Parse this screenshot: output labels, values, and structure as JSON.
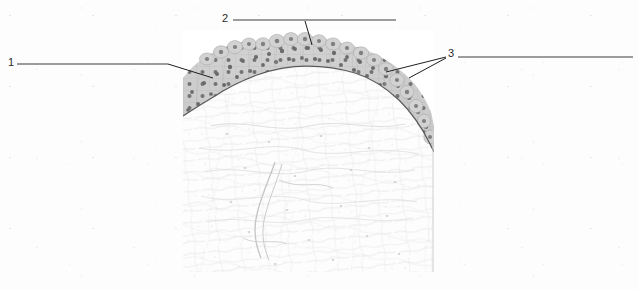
{
  "figure": {
    "kind": "histology-micrograph-labeled-diagram",
    "tissue": "transitional epithelium",
    "background_color": "#fdfdfd",
    "canvas": {
      "width": 638,
      "height": 290
    }
  },
  "micrograph": {
    "name": "transitional-epithelium-micrograph",
    "bounds": {
      "left": 183,
      "top": 30,
      "width": 251,
      "height": 242
    },
    "epithelium_color": "#c9c9c9",
    "nuclei_color": "#6f6f6f",
    "basement_membrane_color": "#5d5d5d",
    "connective_tissue_color": "#fbfbfb",
    "fiber_color": "#cfcfcf"
  },
  "labels": [
    {
      "id": "label-1",
      "text": "1",
      "text_x": 8,
      "text_y": 58,
      "rule": {
        "x1": 17,
        "y1": 64,
        "x2": 168,
        "y2": 64
      },
      "leaders": [
        {
          "x1": 168,
          "y1": 64,
          "x2": 213,
          "y2": 78
        }
      ]
    },
    {
      "id": "label-2",
      "text": "2",
      "text_x": 222,
      "text_y": 13,
      "rule": {
        "x1": 233,
        "y1": 20,
        "x2": 396,
        "y2": 20
      },
      "leaders": [
        {
          "x1": 305,
          "y1": 21,
          "x2": 312,
          "y2": 45
        }
      ]
    },
    {
      "id": "label-3",
      "text": "3",
      "text_x": 448,
      "text_y": 48,
      "rule": {
        "x1": 458,
        "y1": 57,
        "x2": 633,
        "y2": 57
      },
      "leaders": [
        {
          "x1": 446,
          "y1": 57,
          "x2": 386,
          "y2": 72
        },
        {
          "x1": 446,
          "y1": 58,
          "x2": 409,
          "y2": 78
        }
      ]
    }
  ],
  "line_color": "#3a3a3a"
}
